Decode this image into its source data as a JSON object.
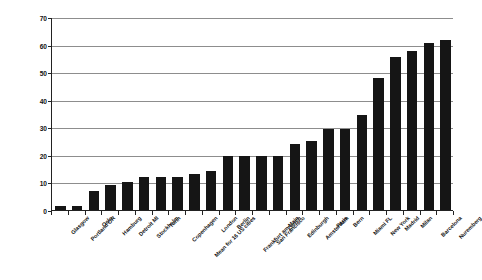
{
  "chart_data": {
    "type": "bar",
    "title": "",
    "xlabel": "",
    "ylabel": "HIV seroprevalence among IVDUs (%)",
    "ylim": [
      0,
      70
    ],
    "yticks": [
      0,
      10,
      20,
      30,
      40,
      50,
      60,
      70
    ],
    "ytick_labels": [
      "0",
      "10",
      "20",
      "30",
      "40",
      "50",
      "60",
      "70"
    ],
    "grid": true,
    "legend": null,
    "bar_color": "#151515",
    "categories": [
      "Glasgow",
      "Portland OR",
      "Oslo",
      "Hamburg",
      "Detroit MI",
      "Stockholm",
      "Turin",
      "Copenhagen",
      "Mean for 16 US cities",
      "London",
      "Berlin",
      "Frankfurt am Main",
      "San Francisco",
      "Zurich",
      "Edinburgh",
      "Amsterdam",
      "Paris",
      "Bern",
      "Miami FL",
      "New York",
      "Madrid",
      "Milan",
      "Barcelona",
      "Nuremberg"
    ],
    "values": [
      1.5,
      1.5,
      7,
      9,
      10,
      12,
      12,
      12,
      13,
      14,
      19.5,
      19.5,
      19.5,
      19.5,
      24,
      25,
      29.5,
      29.5,
      34.5,
      48,
      55.5,
      57.5,
      60.5,
      61.5
    ]
  }
}
